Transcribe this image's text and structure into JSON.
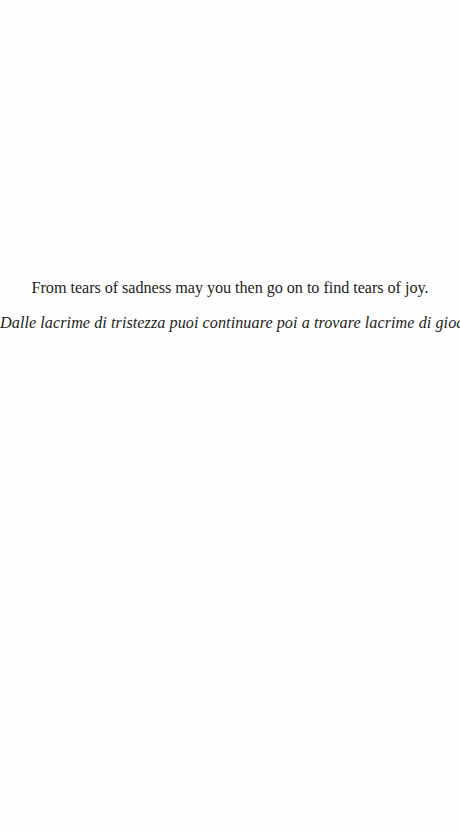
{
  "page": {
    "quote": {
      "english": "From tears of sadness may you then go on to find tears of joy.",
      "italian": "Dalle lacrime di tristezza puoi continuare poi a trovare lacrime di gioa."
    }
  },
  "colors": {
    "background": "#ffffff",
    "text": "#231f20"
  }
}
